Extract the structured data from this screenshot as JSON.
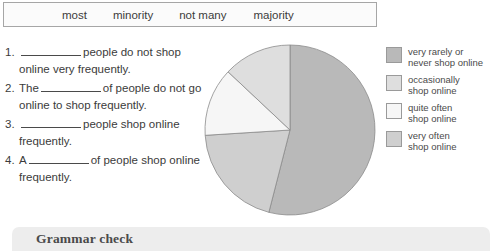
{
  "wordbank": {
    "words": [
      "most",
      "minority",
      "not many",
      "majority"
    ]
  },
  "questions": [
    {
      "num": "1.",
      "before": "",
      "after": "people do not shop online very frequently."
    },
    {
      "num": "2.",
      "before": "The",
      "after": "of people do not go online to shop frequently."
    },
    {
      "num": "3.",
      "before": "",
      "after": "people shop online frequently."
    },
    {
      "num": "4.",
      "before": "A",
      "after": "of people shop online frequently."
    }
  ],
  "legend": {
    "items": [
      {
        "label": "very rarely or\nnever shop online",
        "color": "#b9b9b9"
      },
      {
        "label": "occasionally\nshop online",
        "color": "#dedede"
      },
      {
        "label": "quite often\nshop online",
        "color": "#f6f6f6"
      },
      {
        "label": "very often\nshop online",
        "color": "#cfcfcf"
      }
    ]
  },
  "grammar": {
    "title": "Grammar check"
  },
  "chart_data": {
    "type": "pie",
    "title": "",
    "labels": [
      "very rarely or never shop online",
      "occasionally shop online",
      "quite often shop online",
      "very often shop online"
    ],
    "values": [
      54,
      20,
      13,
      13
    ],
    "unit": "percent",
    "start_angle_deg": 0,
    "direction": "clockwise",
    "colors": [
      "#b9b9b9",
      "#cfcfcf",
      "#f6f6f6",
      "#dedede"
    ],
    "legend_position": "right",
    "grid": false,
    "center": [
      86,
      86
    ],
    "radius": 85
  }
}
